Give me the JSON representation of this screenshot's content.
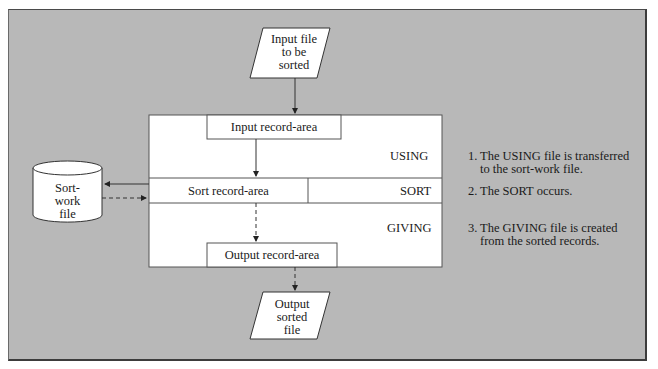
{
  "diagram": {
    "input_file": {
      "lines": [
        "Input file",
        "to be",
        "sorted"
      ]
    },
    "output_file": {
      "lines": [
        "Output",
        "sorted",
        "file"
      ]
    },
    "sort_work_file": {
      "lines": [
        "Sort-",
        "work",
        "file"
      ]
    },
    "areas": {
      "input_record_area": "Input record-area",
      "sort_record_area": "Sort record-area",
      "output_record_area": "Output record-area"
    },
    "phases": {
      "using": "USING",
      "sort": "SORT",
      "giving": "GIVING"
    },
    "steps": [
      {
        "number": "1.",
        "line1": "The USING file is transferred",
        "line2": "to the sort-work file."
      },
      {
        "number": "2.",
        "line1": "The SORT occurs.",
        "line2": ""
      },
      {
        "number": "3.",
        "line1": "The GIVING file is created",
        "line2": "from the sorted records."
      }
    ],
    "colors": {
      "background_panel": "#b8b8b8",
      "box_fill": "#ffffff",
      "line": "#333333"
    }
  }
}
